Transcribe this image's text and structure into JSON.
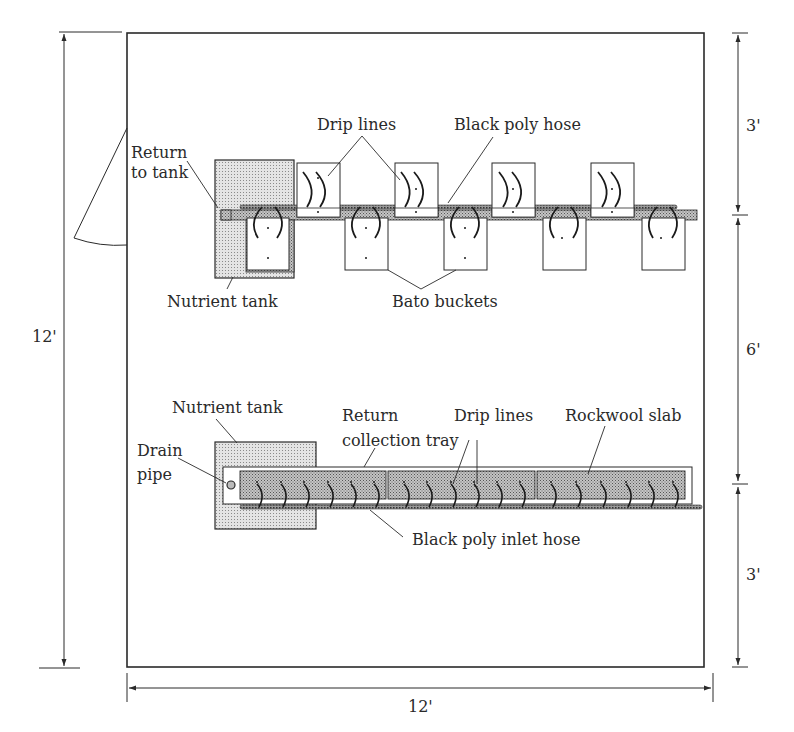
{
  "diagram": {
    "title": "",
    "colors": {
      "line": "#2a2a2a",
      "tank_fill": "#d2d2d2",
      "slab_fill": "#b8b8b8",
      "hose_fill": "#6a6a6a",
      "background": "#ffffff"
    },
    "room": {
      "width_label": "12'",
      "height_label": "12'",
      "right_dimensions": [
        "3'",
        "6'",
        "3'"
      ]
    },
    "top_system": {
      "labels": {
        "return_line1": "Return",
        "return_line2": "to tank",
        "drip_lines": "Drip lines",
        "black_poly_hose": "Black poly hose",
        "nutrient_tank": "Nutrient tank",
        "bato_buckets": "Bato buckets"
      },
      "upper_bucket_count": 4,
      "lower_bucket_count": 5
    },
    "bottom_system": {
      "labels": {
        "nutrient_tank": "Nutrient tank",
        "drain_line1": "Drain",
        "drain_line2": "pipe",
        "return_line1": "Return",
        "return_line2": "collection tray",
        "drip_lines": "Drip lines",
        "rockwool_slab": "Rockwool slab",
        "black_poly_inlet_hose": "Black poly inlet hose"
      },
      "slab_count": 3,
      "drippers_per_slab": 6
    }
  }
}
